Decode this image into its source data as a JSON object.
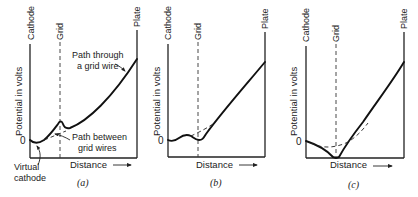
{
  "figure": {
    "panels": [
      {
        "id": "a",
        "caption": "(a)",
        "electrode_labels": {
          "cathode": "Cathode",
          "grid": "Grid",
          "plate": "Plate"
        },
        "y_label": "Potential in volts",
        "x_label": "Distance",
        "zero_label": "0",
        "annotations": {
          "through_wire_line1": "Path through",
          "through_wire_line2": "a grid wire",
          "between_wires_line1": "Path between",
          "between_wires_line2": "grid wires",
          "virtual_cathode_line1": "Virtual",
          "virtual_cathode_line2": "cathode"
        }
      },
      {
        "id": "b",
        "caption": "(b)",
        "electrode_labels": {
          "cathode": "Cathode",
          "grid": "Grid",
          "plate": "Plate"
        },
        "y_label": "Potential in volts",
        "x_label": "Distance",
        "zero_label": "0"
      },
      {
        "id": "c",
        "caption": "(c)",
        "electrode_labels": {
          "cathode": "Cathode",
          "grid": "Grid",
          "plate": "Plate"
        },
        "y_label": "Potential in volts",
        "x_label": "Distance",
        "zero_label": "0"
      }
    ]
  }
}
